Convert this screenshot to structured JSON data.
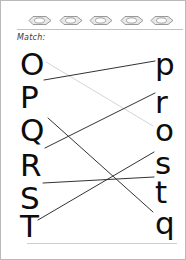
{
  "worksheet": {
    "instruction_label": "Match:",
    "header_icon_name": "boat-icon",
    "header_icon_count": 5,
    "header_icons": [
      {
        "name": "boat-icon-1"
      },
      {
        "name": "boat-icon-2"
      },
      {
        "name": "boat-icon-3"
      },
      {
        "name": "boat-icon-4"
      },
      {
        "name": "boat-icon-5"
      }
    ],
    "left_column": [
      {
        "label": "O",
        "x": 13,
        "y": 44
      },
      {
        "label": "P",
        "x": 13,
        "y": 77
      },
      {
        "label": "Q",
        "x": 13,
        "y": 110
      },
      {
        "label": "R",
        "x": 13,
        "y": 145
      },
      {
        "label": "S",
        "x": 13,
        "y": 178
      },
      {
        "label": "T",
        "x": 13,
        "y": 206
      }
    ],
    "right_column": [
      {
        "label": "p",
        "x": 148,
        "y": 44
      },
      {
        "label": "r",
        "x": 148,
        "y": 82
      },
      {
        "label": "o",
        "x": 148,
        "y": 110
      },
      {
        "label": "s",
        "x": 148,
        "y": 143
      },
      {
        "label": "t",
        "x": 148,
        "y": 172
      },
      {
        "label": "q",
        "x": 148,
        "y": 203
      }
    ],
    "connections": [
      {
        "from": "O",
        "to": "o",
        "x1": 39,
        "y1": 57,
        "x2": 146,
        "y2": 121,
        "color": "#cfcfcf",
        "width": 0.9
      },
      {
        "from": "P",
        "to": "p",
        "x1": 37,
        "y1": 75,
        "x2": 148,
        "y2": 56,
        "color": "#333333",
        "width": 1.0
      },
      {
        "from": "Q",
        "to": "q",
        "x1": 41,
        "y1": 113,
        "x2": 146,
        "y2": 207,
        "color": "#333333",
        "width": 1.0
      },
      {
        "from": "R",
        "to": "r",
        "x1": 38,
        "y1": 143,
        "x2": 148,
        "y2": 88,
        "color": "#333333",
        "width": 1.0
      },
      {
        "from": "S",
        "to": "t",
        "x1": 36,
        "y1": 178,
        "x2": 147,
        "y2": 172,
        "color": "#333333",
        "width": 1.0
      },
      {
        "from": "T",
        "to": "s",
        "x1": 31,
        "y1": 215,
        "x2": 147,
        "y2": 147,
        "color": "#333333",
        "width": 1.0
      }
    ],
    "colors": {
      "page_background": "#ffffff",
      "page_border": "#b9b9b9",
      "letter_color": "#0d0d0d",
      "rule_color": "#c2c2c2",
      "line_dark": "#333333",
      "line_faint": "#cfcfcf"
    }
  }
}
